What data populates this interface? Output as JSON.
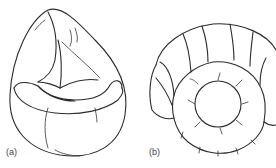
{
  "figure": {
    "panels": [
      {
        "id": "a",
        "label": "(a)",
        "subject": "teardrop-shaped bean bag chair",
        "icon": "bean-bag-chair-icon"
      },
      {
        "id": "b",
        "label": "(b)",
        "subject": "round padded chair with segmented backrest and circular seat",
        "icon": "round-segmented-chair-icon"
      }
    ],
    "line_color": "#2a2a2a",
    "background": "#ffffff"
  }
}
